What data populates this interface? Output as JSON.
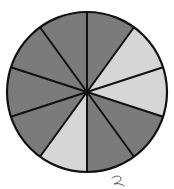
{
  "diagram": {
    "type": "fraction-circle",
    "total_slices": 10,
    "start_angle_deg": 0,
    "direction": "clockwise",
    "slices": [
      {
        "index": 1,
        "shade": "dark"
      },
      {
        "index": 2,
        "shade": "light"
      },
      {
        "index": 3,
        "shade": "light"
      },
      {
        "index": 4,
        "shade": "dark"
      },
      {
        "index": 5,
        "shade": "dark"
      },
      {
        "index": 6,
        "shade": "light"
      },
      {
        "index": 7,
        "shade": "dark"
      },
      {
        "index": 8,
        "shade": "dark"
      },
      {
        "index": 9,
        "shade": "dark"
      },
      {
        "index": 10,
        "shade": "dark"
      }
    ],
    "light_count": 3,
    "dark_count": 7,
    "colors": {
      "dark": "#7b7b7b",
      "light": "#d6d6d6",
      "outline": "#111111"
    },
    "center": [
      87,
      92
    ],
    "radius": 80
  },
  "annotation": {
    "handwritten_mark": "2"
  }
}
